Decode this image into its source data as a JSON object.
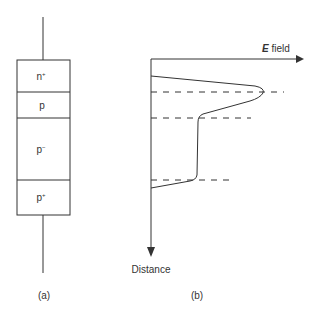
{
  "figure_a": {
    "caption": "(a)",
    "layers": [
      {
        "base": "n",
        "sup": "+"
      },
      {
        "base": "p",
        "sup": ""
      },
      {
        "base": "p",
        "sup": "−"
      },
      {
        "base": "p",
        "sup": "+"
      }
    ]
  },
  "figure_b": {
    "caption": "(b)",
    "x_axis": {
      "symbol": "E",
      "label": " field"
    },
    "y_axis": {
      "label": "Distance"
    }
  },
  "colors": {
    "line": "#333333",
    "background": "#ffffff"
  }
}
